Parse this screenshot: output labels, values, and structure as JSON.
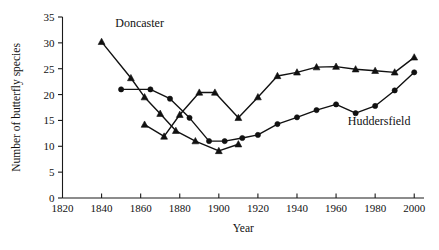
{
  "chart_data": {
    "type": "line",
    "title": "",
    "xlabel": "Year",
    "ylabel": "Number of butterfly species",
    "xlim": [
      1820,
      2005
    ],
    "ylim": [
      0,
      35
    ],
    "xticks": [
      1820,
      1840,
      1860,
      1880,
      1900,
      1920,
      1940,
      1960,
      1980,
      2000
    ],
    "xticklabels": [
      "1820",
      "1840",
      "1860",
      "1880",
      "1900",
      "1920",
      "1940",
      "1960",
      "1980",
      "2000"
    ],
    "yticks": [
      0,
      5,
      10,
      15,
      20,
      25,
      30,
      35
    ],
    "yticklabels": [
      "0",
      "5",
      "10",
      "15",
      "20",
      "25",
      "30",
      "35"
    ],
    "grid": false,
    "legend_position": "inline-annotation",
    "series": [
      {
        "name": "Doncaster",
        "marker": "triangle",
        "color": "#111111",
        "label_x": 1847,
        "label_y": 33,
        "points": [
          {
            "x": 1840,
            "y": 30.2
          },
          {
            "x": 1855,
            "y": 23.2
          },
          {
            "x": 1862,
            "y": 19.5
          },
          {
            "x": 1870,
            "y": 16.3
          },
          {
            "x": 1878,
            "y": 13.0
          },
          {
            "x": 1888,
            "y": 11.0
          },
          {
            "x": 1900,
            "y": 9.1
          },
          {
            "x": 1910,
            "y": 10.4
          }
        ]
      },
      {
        "name": "Doncaster-upper",
        "marker": "triangle",
        "color": "#111111",
        "points": [
          {
            "x": 1862,
            "y": 14.2
          },
          {
            "x": 1872,
            "y": 11.9
          },
          {
            "x": 1880,
            "y": 16.1
          },
          {
            "x": 1890,
            "y": 20.4
          },
          {
            "x": 1898,
            "y": 20.4
          },
          {
            "x": 1910,
            "y": 15.5
          },
          {
            "x": 1920,
            "y": 19.5
          },
          {
            "x": 1930,
            "y": 23.6
          },
          {
            "x": 1940,
            "y": 24.3
          },
          {
            "x": 1950,
            "y": 25.3
          },
          {
            "x": 1960,
            "y": 25.4
          },
          {
            "x": 1970,
            "y": 24.9
          },
          {
            "x": 1980,
            "y": 24.6
          },
          {
            "x": 1990,
            "y": 24.3
          },
          {
            "x": 2000,
            "y": 27.2
          }
        ]
      },
      {
        "name": "Huddersfield",
        "marker": "circle",
        "color": "#111111",
        "label_x": 1966,
        "label_y": 14.2,
        "points": [
          {
            "x": 1850,
            "y": 21.0
          },
          {
            "x": 1865,
            "y": 21.0
          },
          {
            "x": 1875,
            "y": 19.2
          },
          {
            "x": 1885,
            "y": 15.5
          },
          {
            "x": 1895,
            "y": 11.0
          },
          {
            "x": 1903,
            "y": 11.0
          },
          {
            "x": 1912,
            "y": 11.6
          },
          {
            "x": 1920,
            "y": 12.2
          },
          {
            "x": 1930,
            "y": 14.3
          },
          {
            "x": 1940,
            "y": 15.6
          },
          {
            "x": 1950,
            "y": 17.0
          },
          {
            "x": 1960,
            "y": 18.1
          },
          {
            "x": 1970,
            "y": 16.4
          },
          {
            "x": 1980,
            "y": 17.8
          },
          {
            "x": 1990,
            "y": 20.8
          },
          {
            "x": 2000,
            "y": 24.3
          }
        ]
      }
    ]
  }
}
